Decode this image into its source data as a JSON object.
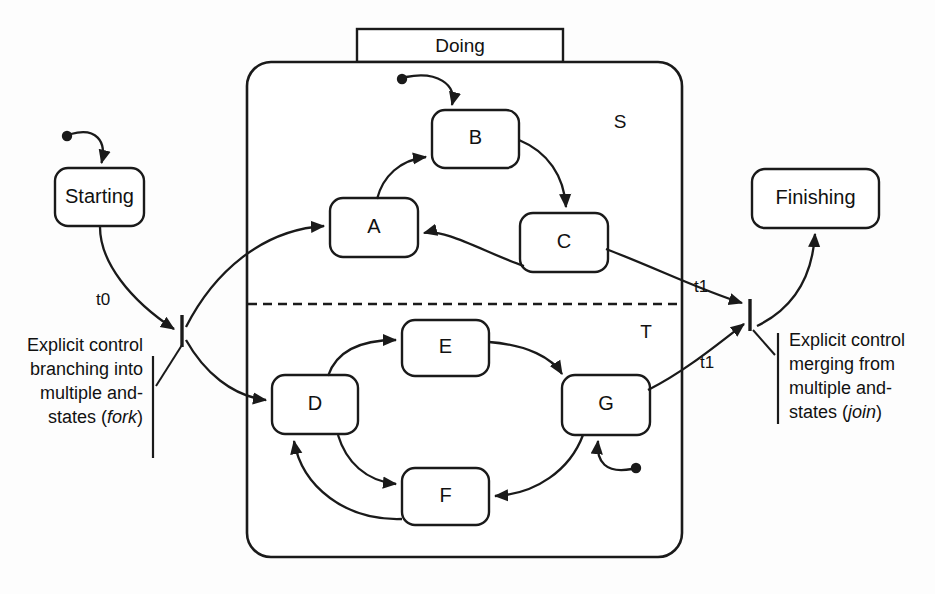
{
  "diagram": {
    "title_tab": "Doing",
    "composite_state": {
      "name": "Doing",
      "region_top_label": "S",
      "region_bottom_label": "T"
    },
    "outer_states": [
      {
        "id": "starting",
        "label": "Starting"
      },
      {
        "id": "finishing",
        "label": "Finishing"
      }
    ],
    "region_s_states": [
      {
        "id": "A",
        "label": "A"
      },
      {
        "id": "B",
        "label": "B"
      },
      {
        "id": "C",
        "label": "C"
      }
    ],
    "region_t_states": [
      {
        "id": "D",
        "label": "D"
      },
      {
        "id": "E",
        "label": "E"
      },
      {
        "id": "F",
        "label": "F"
      },
      {
        "id": "G",
        "label": "G"
      }
    ],
    "transition_labels": {
      "t0": "t0",
      "t1_top": "t1",
      "t1_bottom": "t1"
    },
    "annotations": {
      "fork": {
        "lines": [
          "Explicit control",
          "branching into",
          "multiple and-",
          "states ("
        ],
        "emphasis": "fork",
        "tail": ")",
        "align": "right"
      },
      "join": {
        "lines": [
          "Explicit control",
          "merging from",
          "multiple and-",
          "states ("
        ],
        "emphasis": "join",
        "tail": ")",
        "align": "left"
      }
    },
    "colors": {
      "stroke": "#1a1a1a",
      "fill": "#ffffff",
      "background": "#fdfdfd",
      "text": "#111111"
    }
  }
}
